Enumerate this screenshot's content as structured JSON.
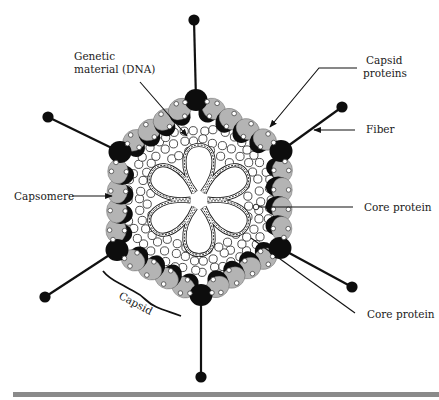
{
  "figure": {
    "colors": {
      "capsomere_fill": "#b4b4b4",
      "capsomere_shadow": "#0d0d0d",
      "penton": "#0d0d0d",
      "line": "#111111",
      "core_protein_stroke": "#222222",
      "bar": "#8a8a8a"
    },
    "center": [
      199,
      200
    ],
    "vertices": [
      {
        "name": "top",
        "x": 196,
        "y": 100,
        "fiber_end": [
          194,
          20
        ]
      },
      {
        "name": "upper-right",
        "x": 281,
        "y": 151,
        "fiber_end": [
          342,
          107
        ]
      },
      {
        "name": "lower-right",
        "x": 280,
        "y": 248,
        "fiber_end": [
          352,
          287
        ]
      },
      {
        "name": "bottom",
        "x": 201,
        "y": 295,
        "fiber_end": [
          201,
          377
        ]
      },
      {
        "name": "lower-left",
        "x": 117,
        "y": 250,
        "fiber_end": [
          45,
          297
        ]
      },
      {
        "name": "upper-left",
        "x": 120,
        "y": 152,
        "fiber_end": [
          48,
          117
        ]
      }
    ],
    "capsomeres_per_edge": 4,
    "dna_petals": 6
  },
  "labels": {
    "genetic_material_line1": "Genetic",
    "genetic_material_line2": "material (DNA)",
    "capsid_proteins_line1": "Capsid",
    "capsid_proteins_line2": "proteins",
    "fiber": "Fiber",
    "capsomere": "Capsomere",
    "core_protein_1": "Core protein",
    "core_protein_2": "Core protein",
    "capsid": "Capsid"
  }
}
